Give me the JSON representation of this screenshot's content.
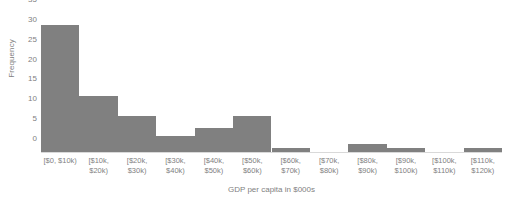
{
  "chart_data": {
    "type": "bar",
    "title": "",
    "xlabel": "GDP per capita in $000s",
    "ylabel": "Frequency",
    "categories": [
      "[$0, $10k)",
      "[$10k,\n$20k)",
      "[$20k,\n$30k)",
      "[$30k,\n$40k)",
      "[$40k,\n$50k)",
      "[$50k,\n$60k)",
      "[$60k,\n$70k)",
      "[$70k,\n$80k)",
      "[$80k,\n$90k)",
      "[$90k,\n$100k)",
      "[$100k,\n$110k)",
      "[$110k,\n$120k)"
    ],
    "values": [
      32,
      14,
      9,
      4,
      6,
      9,
      1,
      0,
      2,
      1,
      0,
      1
    ],
    "ylim": [
      0,
      35
    ],
    "yticks": [
      0,
      5,
      10,
      15,
      20,
      25,
      30,
      35
    ],
    "grid": false,
    "legend": "none",
    "bar_color": "#808080",
    "text_color": "#7f7f7f",
    "axis_color": "#d9d9d9"
  }
}
